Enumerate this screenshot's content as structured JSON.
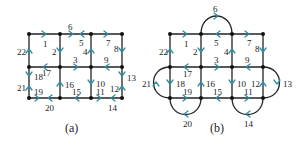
{
  "figure": {
    "panels": [
      {
        "caption": "(a)",
        "edge_labels": [
          "1",
          "2",
          "3",
          "4",
          "5",
          "6",
          "7",
          "8",
          "9",
          "10",
          "11",
          "12",
          "13",
          "14",
          "15",
          "16",
          "17",
          "18",
          "19",
          "20",
          "21",
          "22"
        ]
      },
      {
        "caption": "(b)",
        "edge_labels": [
          "1",
          "2",
          "3",
          "4",
          "5",
          "6",
          "7",
          "8",
          "9",
          "10",
          "11",
          "12",
          "13",
          "14",
          "15",
          "16",
          "17",
          "18",
          "19",
          "20",
          "21",
          "22"
        ]
      }
    ],
    "colors": {
      "edge": "#222222",
      "arrow": "#2f8fa0",
      "node": "#111111"
    }
  },
  "a": {
    "caption": "(a)",
    "l1": "1",
    "l2": "2",
    "l3": "3",
    "l4": "4",
    "l5": "5",
    "l6": "6",
    "l7": "7",
    "l8": "8",
    "l9": "9",
    "l10": "10",
    "l11": "11",
    "l12": "12",
    "l13": "13",
    "l14": "14",
    "l15": "15",
    "l16": "16",
    "l17": "17",
    "l18": "18",
    "l19": "19",
    "l20": "20",
    "l21": "21",
    "l22": "22"
  },
  "b": {
    "caption": "(b)",
    "l1": "1",
    "l2": "2",
    "l3": "3",
    "l4": "4",
    "l5": "5",
    "l6": "6",
    "l7": "7",
    "l8": "8",
    "l9": "9",
    "l10": "10",
    "l11": "11",
    "l12": "12",
    "l13": "13",
    "l14": "14",
    "l15": "15",
    "l16": "16",
    "l17": "17",
    "l18": "18",
    "l19": "19",
    "l20": "20",
    "l21": "21",
    "l22": "22"
  }
}
